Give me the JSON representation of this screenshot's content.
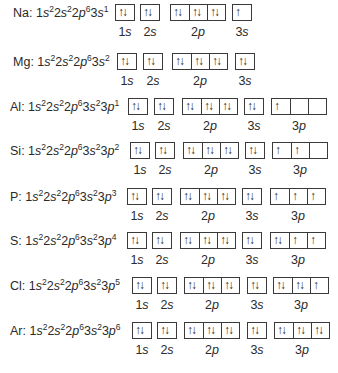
{
  "rows": [
    {
      "symbol": "Na",
      "config": [
        [
          "1",
          "s",
          "2"
        ],
        [
          "2",
          "s",
          "2"
        ],
        [
          "2",
          "p",
          "6"
        ],
        [
          "3",
          "s",
          "1"
        ]
      ],
      "top": 4,
      "text_x": 13,
      "groups": [
        {
          "label_n": "1",
          "label_l": "s",
          "x": 115,
          "boxes": [
            "↑↓"
          ]
        },
        {
          "label_n": "2",
          "label_l": "s",
          "x": 140,
          "boxes": [
            "↑↓"
          ]
        },
        {
          "label_n": "2",
          "label_l": "p",
          "x": 170,
          "boxes": [
            "↑↓",
            "↑↓",
            "↑↓"
          ]
        },
        {
          "label_n": "3",
          "label_l": "s",
          "x": 232,
          "boxes": [
            "↑"
          ]
        }
      ]
    },
    {
      "symbol": "Mg",
      "config": [
        [
          "1",
          "s",
          "2"
        ],
        [
          "2",
          "s",
          "2"
        ],
        [
          "2",
          "p",
          "6"
        ],
        [
          "3",
          "s",
          "2"
        ]
      ],
      "top": 53,
      "text_x": 13,
      "groups": [
        {
          "label_n": "1",
          "label_l": "s",
          "x": 117,
          "boxes": [
            "↑↓"
          ]
        },
        {
          "label_n": "2",
          "label_l": "s",
          "x": 143,
          "boxes": [
            "↑↓"
          ]
        },
        {
          "label_n": "2",
          "label_l": "p",
          "x": 172,
          "boxes": [
            "↑↓",
            "↑↓",
            "↑↓"
          ]
        },
        {
          "label_n": "3",
          "label_l": "s",
          "x": 235,
          "boxes": [
            "↑↓"
          ]
        }
      ]
    },
    {
      "symbol": "Al",
      "config": [
        [
          "1",
          "s",
          "2"
        ],
        [
          "2",
          "s",
          "2"
        ],
        [
          "2",
          "p",
          "6"
        ],
        [
          "3",
          "s",
          "2"
        ],
        [
          "3",
          "p",
          "1"
        ]
      ],
      "top": 98,
      "text_x": 10,
      "groups": [
        {
          "label_n": "1",
          "label_l": "s",
          "x": 128,
          "boxes": [
            "↑↓"
          ]
        },
        {
          "label_n": "2",
          "label_l": "s",
          "x": 154,
          "boxes": [
            "↑↓"
          ]
        },
        {
          "label_n": "2",
          "label_l": "p",
          "x": 182,
          "boxes": [
            "↑↓",
            "↑↓",
            "↑↓"
          ]
        },
        {
          "label_n": "3",
          "label_l": "s",
          "x": 244,
          "boxes": [
            "↑↓"
          ]
        },
        {
          "label_n": "3",
          "label_l": "p",
          "x": 271,
          "boxes": [
            "↑",
            "",
            ""
          ]
        }
      ]
    },
    {
      "symbol": "Si",
      "config": [
        [
          "1",
          "s",
          "2"
        ],
        [
          "2",
          "s",
          "2"
        ],
        [
          "2",
          "p",
          "6"
        ],
        [
          "3",
          "s",
          "2"
        ],
        [
          "3",
          "p",
          "2"
        ]
      ],
      "top": 142,
      "text_x": 10,
      "groups": [
        {
          "label_n": "1",
          "label_l": "s",
          "x": 130,
          "boxes": [
            "↑↓"
          ]
        },
        {
          "label_n": "2",
          "label_l": "s",
          "x": 155,
          "boxes": [
            "↑↓"
          ]
        },
        {
          "label_n": "2",
          "label_l": "p",
          "x": 183,
          "boxes": [
            "↑↓",
            "↑↓",
            "↑↓"
          ]
        },
        {
          "label_n": "3",
          "label_l": "s",
          "x": 245,
          "boxes": [
            "↑↓"
          ]
        },
        {
          "label_n": "3",
          "label_l": "p",
          "x": 272,
          "boxes": [
            "↑",
            "↑",
            ""
          ]
        }
      ]
    },
    {
      "symbol": "P",
      "config": [
        [
          "1",
          "s",
          "2"
        ],
        [
          "2",
          "s",
          "2"
        ],
        [
          "2",
          "p",
          "6"
        ],
        [
          "3",
          "s",
          "2"
        ],
        [
          "3",
          "p",
          "3"
        ]
      ],
      "top": 188,
      "text_x": 10,
      "groups": [
        {
          "label_n": "1",
          "label_l": "s",
          "x": 127,
          "boxes": [
            "↑↓"
          ]
        },
        {
          "label_n": "2",
          "label_l": "s",
          "x": 152,
          "boxes": [
            "↑↓"
          ]
        },
        {
          "label_n": "2",
          "label_l": "p",
          "x": 180,
          "boxes": [
            "↑↓",
            "↑↓",
            "↑↓"
          ]
        },
        {
          "label_n": "3",
          "label_l": "s",
          "x": 242,
          "boxes": [
            "↑↓"
          ]
        },
        {
          "label_n": "3",
          "label_l": "p",
          "x": 270,
          "boxes": [
            "↑",
            "↑",
            "↑"
          ]
        }
      ]
    },
    {
      "symbol": "S",
      "config": [
        [
          "1",
          "s",
          "2"
        ],
        [
          "2",
          "s",
          "2"
        ],
        [
          "2",
          "p",
          "6"
        ],
        [
          "3",
          "s",
          "2"
        ],
        [
          "3",
          "p",
          "4"
        ]
      ],
      "top": 232,
      "text_x": 10,
      "groups": [
        {
          "label_n": "1",
          "label_l": "s",
          "x": 127,
          "boxes": [
            "↑↓"
          ]
        },
        {
          "label_n": "2",
          "label_l": "s",
          "x": 152,
          "boxes": [
            "↑↓"
          ]
        },
        {
          "label_n": "2",
          "label_l": "p",
          "x": 180,
          "boxes": [
            "↑↓",
            "↑↓",
            "↑↓"
          ]
        },
        {
          "label_n": "3",
          "label_l": "s",
          "x": 242,
          "boxes": [
            "↑↓"
          ]
        },
        {
          "label_n": "3",
          "label_l": "p",
          "x": 270,
          "boxes": [
            "↑↓",
            "↑",
            "↑"
          ]
        }
      ]
    },
    {
      "symbol": "Cl",
      "config": [
        [
          "1",
          "s",
          "2"
        ],
        [
          "2",
          "s",
          "2"
        ],
        [
          "2",
          "p",
          "6"
        ],
        [
          "3",
          "s",
          "2"
        ],
        [
          "3",
          "p",
          "5"
        ]
      ],
      "top": 277,
      "text_x": 10,
      "groups": [
        {
          "label_n": "1",
          "label_l": "s",
          "x": 132,
          "boxes": [
            "↑↓"
          ]
        },
        {
          "label_n": "2",
          "label_l": "s",
          "x": 157,
          "boxes": [
            "↑↓"
          ]
        },
        {
          "label_n": "2",
          "label_l": "p",
          "x": 184,
          "boxes": [
            "↑↓",
            "↑↓",
            "↑↓"
          ]
        },
        {
          "label_n": "3",
          "label_l": "s",
          "x": 247,
          "boxes": [
            "↑↓"
          ]
        },
        {
          "label_n": "3",
          "label_l": "p",
          "x": 273,
          "boxes": [
            "↑↓",
            "↑↓",
            "↑"
          ]
        }
      ]
    },
    {
      "symbol": "Ar",
      "config": [
        [
          "1",
          "s",
          "2"
        ],
        [
          "2",
          "s",
          "2"
        ],
        [
          "2",
          "p",
          "6"
        ],
        [
          "3",
          "s",
          "2"
        ],
        [
          "3",
          "p",
          "6"
        ]
      ],
      "top": 322,
      "text_x": 10,
      "groups": [
        {
          "label_n": "1",
          "label_l": "s",
          "x": 132,
          "boxes": [
            "↑↓"
          ]
        },
        {
          "label_n": "2",
          "label_l": "s",
          "x": 157,
          "boxes": [
            "↑↓"
          ]
        },
        {
          "label_n": "2",
          "label_l": "p",
          "x": 184,
          "boxes": [
            "↑↓",
            "↑↓",
            "↑↓"
          ]
        },
        {
          "label_n": "3",
          "label_l": "s",
          "x": 247,
          "boxes": [
            "↑↓"
          ]
        },
        {
          "label_n": "3",
          "label_l": "p",
          "x": 274,
          "boxes": [
            "↑↓",
            "↑↓",
            "↑↓"
          ]
        }
      ]
    }
  ]
}
